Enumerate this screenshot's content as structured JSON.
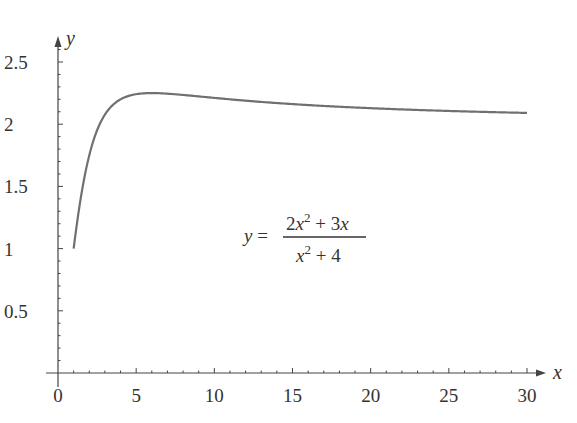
{
  "chart_data": {
    "type": "line",
    "title": "",
    "xlabel": "x",
    "ylabel": "y",
    "xlim": [
      0,
      30
    ],
    "ylim": [
      0,
      2.5
    ],
    "grid": false,
    "legend": null,
    "x_ticks": [
      "0",
      "5",
      "10",
      "15",
      "20",
      "25",
      "30"
    ],
    "y_ticks": [
      "0.5",
      "1",
      "1.5",
      "2",
      "2.5"
    ],
    "x_minor_tick_step": 1,
    "y_minor_tick_step": 0.1,
    "annotation": {
      "lhs": "y =",
      "numerator": "2x² + 3x",
      "denominator": "x² + 4"
    },
    "series": [
      {
        "name": "y = (2x² + 3x)/(x² + 4)",
        "color": "#707070",
        "x": [
          1,
          1.5,
          2,
          2.5,
          3,
          4,
          5,
          6,
          7,
          8,
          10,
          12,
          15,
          18,
          20,
          25,
          30
        ],
        "values": [
          1.0,
          1.44,
          1.75,
          1.95,
          2.08,
          2.2,
          2.24,
          2.25,
          2.25,
          2.24,
          2.21,
          2.19,
          2.16,
          2.14,
          2.13,
          2.11,
          2.09
        ]
      }
    ]
  }
}
